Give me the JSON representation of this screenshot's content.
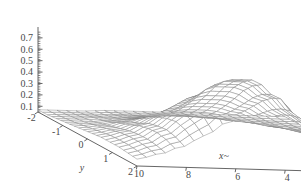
{
  "chart_data": {
    "type": "surface",
    "title": "",
    "xlabel": "x~",
    "ylabel": "y",
    "zlabel": "",
    "xlim": [
      0,
      10
    ],
    "ylim": [
      -2,
      2
    ],
    "zlim": [
      0.05,
      0.78
    ],
    "x_ticks": [
      "10",
      "8",
      "6",
      "4",
      "2",
      "0"
    ],
    "x_tick_values": [
      10,
      8,
      6,
      4,
      2,
      0
    ],
    "y_ticks": [
      "-2",
      "-1",
      "0",
      "1",
      "2"
    ],
    "y_tick_values": [
      -2,
      -1,
      0,
      1,
      2
    ],
    "z_ticks": [
      "0.1",
      "0.2",
      "0.3",
      "0.4",
      "0.5",
      "0.6",
      "0.7"
    ],
    "z_tick_values": [
      0.1,
      0.2,
      0.3,
      0.4,
      0.5,
      0.6,
      0.7
    ],
    "x_axis_reversed": true,
    "grid": false,
    "legend": "none",
    "mesh_color": "#808080",
    "face_color": "#ffffff",
    "axis_color": "#555555",
    "background": "#ffffff",
    "mesh_nx": 26,
    "mesh_ny": 22,
    "z_peak": 0.75,
    "z_floor": 0.07,
    "surface_z": [
      [
        0.07,
        0.07,
        0.07,
        0.08,
        0.08,
        0.08,
        0.08,
        0.08,
        0.07,
        0.07,
        0.07,
        0.07
      ],
      [
        0.07,
        0.08,
        0.08,
        0.09,
        0.09,
        0.1,
        0.1,
        0.09,
        0.08,
        0.08,
        0.07,
        0.07
      ],
      [
        0.08,
        0.09,
        0.1,
        0.11,
        0.12,
        0.13,
        0.13,
        0.12,
        0.1,
        0.09,
        0.08,
        0.07
      ],
      [
        0.09,
        0.1,
        0.12,
        0.14,
        0.17,
        0.19,
        0.19,
        0.17,
        0.14,
        0.11,
        0.09,
        0.08
      ],
      [
        0.1,
        0.12,
        0.15,
        0.19,
        0.24,
        0.27,
        0.27,
        0.24,
        0.19,
        0.14,
        0.11,
        0.08
      ],
      [
        0.11,
        0.14,
        0.19,
        0.25,
        0.32,
        0.37,
        0.37,
        0.32,
        0.25,
        0.18,
        0.13,
        0.09
      ],
      [
        0.12,
        0.16,
        0.22,
        0.31,
        0.41,
        0.48,
        0.48,
        0.41,
        0.31,
        0.22,
        0.15,
        0.1
      ],
      [
        0.13,
        0.18,
        0.26,
        0.37,
        0.5,
        0.6,
        0.6,
        0.5,
        0.37,
        0.26,
        0.17,
        0.11
      ],
      [
        0.13,
        0.19,
        0.28,
        0.41,
        0.57,
        0.69,
        0.69,
        0.57,
        0.41,
        0.28,
        0.18,
        0.11
      ],
      [
        0.13,
        0.19,
        0.29,
        0.43,
        0.61,
        0.75,
        0.75,
        0.61,
        0.43,
        0.29,
        0.19,
        0.12
      ],
      [
        0.12,
        0.18,
        0.27,
        0.4,
        0.56,
        0.69,
        0.69,
        0.56,
        0.4,
        0.27,
        0.18,
        0.11
      ],
      [
        0.11,
        0.16,
        0.23,
        0.33,
        0.45,
        0.55,
        0.55,
        0.45,
        0.33,
        0.23,
        0.15,
        0.1
      ]
    ]
  }
}
